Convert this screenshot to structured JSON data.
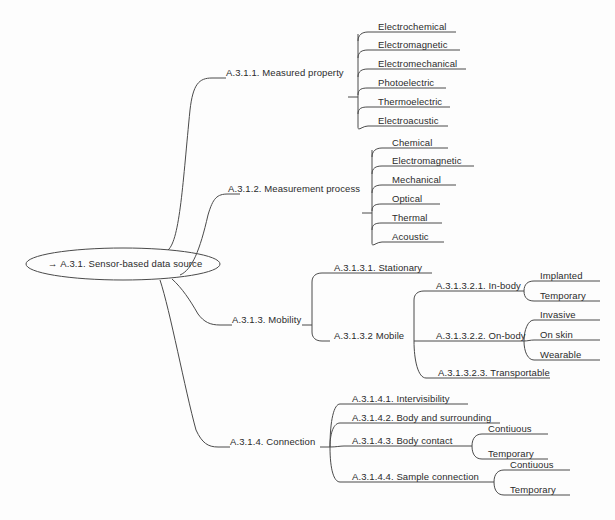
{
  "diagram": {
    "line_color": "#4a4a4a",
    "text_color": "#2b2b2b",
    "background": "#fdfdfd"
  },
  "root": {
    "arrow": "→",
    "label": "A.3.1. Sensor-based data source"
  },
  "branches": {
    "measured_property": {
      "label": "A.3.1.1. Measured property",
      "leaves": [
        {
          "label": "Electrochemical"
        },
        {
          "label": "Electromagnetic"
        },
        {
          "label": "Electromechanical"
        },
        {
          "label": "Photoelectric"
        },
        {
          "label": "Thermoelectric"
        },
        {
          "label": "Electroacustic"
        }
      ]
    },
    "measurement_process": {
      "label": "A.3.1.2. Measurement process",
      "leaves": [
        {
          "label": "Chemical"
        },
        {
          "label": "Electromagnetic"
        },
        {
          "label": "Mechanical"
        },
        {
          "label": "Optical"
        },
        {
          "label": "Thermal"
        },
        {
          "label": "Acoustic"
        }
      ]
    },
    "mobility": {
      "label": "A.3.1.3. Mobility",
      "children": [
        {
          "label": "A.3.1.3.1. Stationary"
        },
        {
          "label": "A.3.1.3.2  Mobile",
          "children": [
            {
              "label": "A.3.1.3.2.1. In-body",
              "leaves": [
                {
                  "label": "Implanted"
                },
                {
                  "label": "Temporary"
                }
              ]
            },
            {
              "label": "A.3.1.3.2.2. On-body",
              "leaves": [
                {
                  "label": "Invasive"
                },
                {
                  "label": "On skin"
                },
                {
                  "label": "Wearable"
                }
              ]
            },
            {
              "label": "A.3.1.3.2.3. Transportable"
            }
          ]
        }
      ]
    },
    "connection": {
      "label": "A.3.1.4. Connection",
      "children": [
        {
          "label": "A.3.1.4.1. Intervisibility"
        },
        {
          "label": "A.3.1.4.2. Body and surrounding"
        },
        {
          "label": "A.3.1.4.3. Body contact",
          "leaves": [
            {
              "label": "Contiuous"
            },
            {
              "label": "Temporary"
            }
          ]
        },
        {
          "label": "A.3.1.4.4. Sample connection",
          "leaves": [
            {
              "label": "Contiuous"
            },
            {
              "label": "Temporary"
            }
          ]
        }
      ]
    }
  }
}
